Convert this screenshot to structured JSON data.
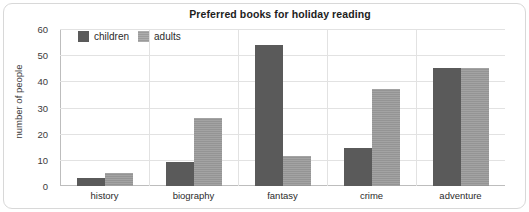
{
  "chart_data": {
    "type": "bar",
    "title": "Preferred books for holiday reading",
    "xlabel": "",
    "ylabel": "number of people",
    "categories": [
      "history",
      "biography",
      "fantasy",
      "crime",
      "adventure"
    ],
    "series": [
      {
        "name": "children",
        "color": "#5a5a5a",
        "values": [
          3,
          9,
          54,
          14.5,
          45
        ]
      },
      {
        "name": "adults",
        "color": "#949494",
        "values": [
          5,
          26,
          11.5,
          37,
          45
        ]
      }
    ],
    "ylim": [
      0,
      60
    ],
    "yticks": [
      0,
      10,
      20,
      30,
      40,
      50,
      60
    ],
    "ytick_labels": [
      "0",
      "10",
      "20",
      "30",
      "40",
      "50",
      "60"
    ],
    "grid": true,
    "legend_position": "top-left-inside",
    "group_separators": true
  },
  "legend": {
    "items": [
      {
        "label": "children",
        "swatch": "children"
      },
      {
        "label": "adults",
        "swatch": "adults"
      }
    ]
  }
}
